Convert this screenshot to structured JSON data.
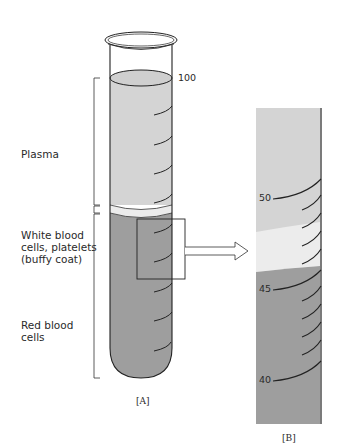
{
  "figure": {
    "panel_a": {
      "label": "[A]",
      "scale_top": "100",
      "layers": [
        {
          "name": "Plasma",
          "lines": [
            "Plasma"
          ]
        },
        {
          "name": "White blood cells, platelets (buffy coat)",
          "lines": [
            "White blood",
            "cells, platelets",
            "(buffy coat)"
          ]
        },
        {
          "name": "Red blood cells",
          "lines": [
            "Red blood",
            "cells"
          ]
        }
      ]
    },
    "panel_b": {
      "label": "[B]",
      "scale_marks": [
        "50",
        "45",
        "40"
      ]
    },
    "colors": {
      "plasma": "#d4d4d4",
      "buffy_coat": "#ececec",
      "red_cells": "#9e9e9e",
      "outline": "#222222"
    }
  }
}
